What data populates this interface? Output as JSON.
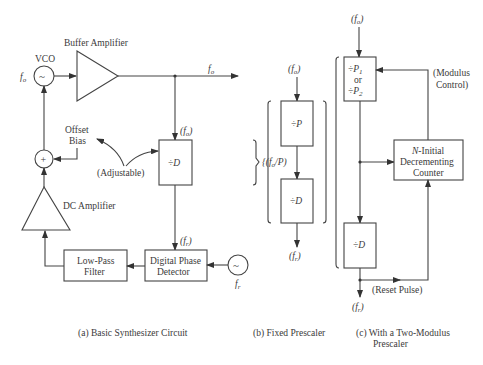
{
  "diagram": {
    "panel_a": {
      "caption": "(a)  Basic Synthesizer Circuit",
      "vco_label": "VCO",
      "vco_freq": "f",
      "vco_freq_sub": "o",
      "vco_symbol": "~",
      "buffer_label": "Buffer Amplifier",
      "output_freq": "f",
      "output_freq_sub": "o",
      "divider_input": "(f",
      "divider_input_sub": "o",
      "divider_input_close": ")",
      "divider_label": "÷D",
      "offset_bias_line1": "Offset",
      "offset_bias_line2": "Bias",
      "adjustable_label": "(Adjustable)",
      "summer_symbol": "+",
      "dc_amp_label": "DC Amplifier",
      "lpf_line1": "Low-Pass",
      "lpf_line2": "Filter",
      "pd_line1": "Digital Phase",
      "pd_line2": "Detector",
      "pd_input": "(f",
      "pd_input_sub": "r",
      "pd_input_close": ")",
      "ref_symbol": "~",
      "ref_freq": "f",
      "ref_freq_sub": "r"
    },
    "panel_b": {
      "caption": "(b)  Fixed Prescaler",
      "input": "(f",
      "input_sub": "o",
      "input_close": ")",
      "prescaler_label": "÷P",
      "mid_freq": "{(f",
      "mid_freq_sub": "o",
      "mid_freq_close": "/P)",
      "divider_label": "÷D",
      "output": "(f",
      "output_sub": "r",
      "output_close": ")"
    },
    "panel_c": {
      "caption_line1": "(c)  With a Two-Modulus",
      "caption_line2": "Prescaler",
      "input": "(f",
      "input_sub": "o",
      "input_close": ")",
      "prescaler_line1": "÷P",
      "prescaler_line1_sub": "1",
      "prescaler_or": "or",
      "prescaler_line2": "÷P",
      "prescaler_line2_sub": "2",
      "modulus_line1": "(Modulus",
      "modulus_line2": "Control)",
      "counter_line1_italic": "N",
      "counter_line1": "-Initial",
      "counter_line2": "Decrementing",
      "counter_line3": "Counter",
      "divider_label": "÷D",
      "reset_label": "(Reset Pulse)",
      "output": "(f",
      "output_sub": "r",
      "output_close": ")"
    }
  }
}
